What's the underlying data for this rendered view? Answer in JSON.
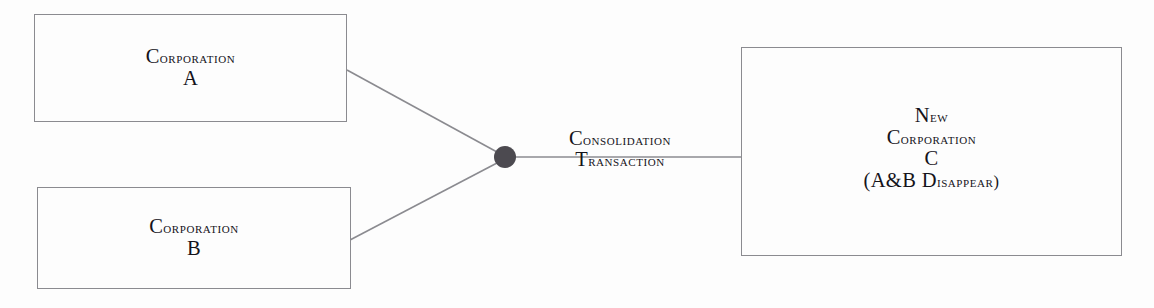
{
  "diagram": {
    "type": "consolidation-merger-diagram",
    "background_color": "#fdfdfd",
    "line_color": "#8b8b90",
    "node_color": "#4c4a50",
    "text_color": "#15131a",
    "source_boxes": [
      {
        "id": "corporation-a",
        "lines": [
          {
            "cap": "C",
            "rest": "orporation"
          },
          {
            "cap": "A",
            "rest": ""
          }
        ],
        "text": "CORPORATION A",
        "x": 34,
        "y": 14,
        "width": 313,
        "height": 108
      },
      {
        "id": "corporation-b",
        "lines": [
          {
            "cap": "C",
            "rest": "orporation"
          },
          {
            "cap": "B",
            "rest": ""
          }
        ],
        "text": "CORPORATION B",
        "x": 37,
        "y": 187,
        "width": 314,
        "height": 102
      }
    ],
    "result_box": {
      "id": "new-corporation-c",
      "lines": [
        {
          "cap": "N",
          "rest": "ew"
        },
        {
          "cap": "C",
          "rest": "orporation"
        },
        {
          "cap": "C",
          "rest": ""
        },
        {
          "cap": "(A&B D",
          "rest": "isappear)"
        }
      ],
      "text": "NEW CORPORATION C (A&B DISAPPEAR)",
      "x": 741,
      "y": 47,
      "width": 381,
      "height": 209
    },
    "transaction_label": {
      "id": "consolidation-transaction",
      "lines": [
        {
          "cap": "C",
          "rest": "onsolidation"
        },
        {
          "cap": "T",
          "rest": "ransaction"
        }
      ],
      "text": "CONSOLIDATION TRANSACTION",
      "x": 528,
      "y": 131
    },
    "junction": {
      "cx": 505,
      "cy": 157,
      "r": 11
    },
    "edges": [
      {
        "from": "corporation-a",
        "to": "junction",
        "x1": 347,
        "y1": 70,
        "x2": 497,
        "y2": 152
      },
      {
        "from": "corporation-b",
        "to": "junction",
        "x1": 350,
        "y1": 240,
        "x2": 497,
        "y2": 163
      },
      {
        "from": "junction",
        "to": "new-corporation-c",
        "x1": 511,
        "y1": 157,
        "x2": 741,
        "y2": 157
      }
    ]
  }
}
